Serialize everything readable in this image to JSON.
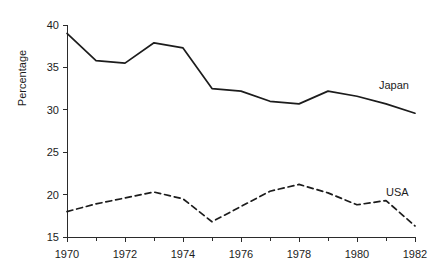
{
  "chart_data": {
    "type": "line",
    "title": "",
    "subtitle": "",
    "xlabel": "",
    "ylabel": "Percentage",
    "x": [
      1970,
      1971,
      1972,
      1973,
      1974,
      1975,
      1976,
      1977,
      1978,
      1979,
      1980,
      1981,
      1982
    ],
    "xlim": [
      1970,
      1982
    ],
    "ylim": [
      15,
      40
    ],
    "grid": false,
    "legend_position": "inline-right-of-line-end",
    "x_tick_values": [
      1970,
      1971,
      1972,
      1973,
      1974,
      1975,
      1976,
      1977,
      1978,
      1979,
      1980,
      1981,
      1982
    ],
    "x_tick_labels": [
      "1970",
      "",
      "1972",
      "",
      "1974",
      "",
      "1976",
      "",
      "1978",
      "",
      "1980",
      "",
      "1982"
    ],
    "y_tick_values": [
      15,
      20,
      25,
      30,
      35,
      40
    ],
    "y_tick_labels": [
      "15",
      "20",
      "25",
      "30",
      "35",
      "40"
    ],
    "series": [
      {
        "name": "Japan",
        "label": "Japan",
        "style": "solid",
        "color": "#1c1c1c",
        "values": [
          39.0,
          35.8,
          35.5,
          37.9,
          37.3,
          32.5,
          32.2,
          31.0,
          30.7,
          32.2,
          31.6,
          30.7,
          29.6
        ]
      },
      {
        "name": "USA",
        "label": "USA",
        "style": "dashed",
        "color": "#1c1c1c",
        "values": [
          18.0,
          18.9,
          19.6,
          20.3,
          19.5,
          16.8,
          18.6,
          20.4,
          21.2,
          20.2,
          18.8,
          19.3,
          16.3
        ]
      }
    ]
  },
  "axes": {
    "y_axis_title": "Percentage"
  }
}
